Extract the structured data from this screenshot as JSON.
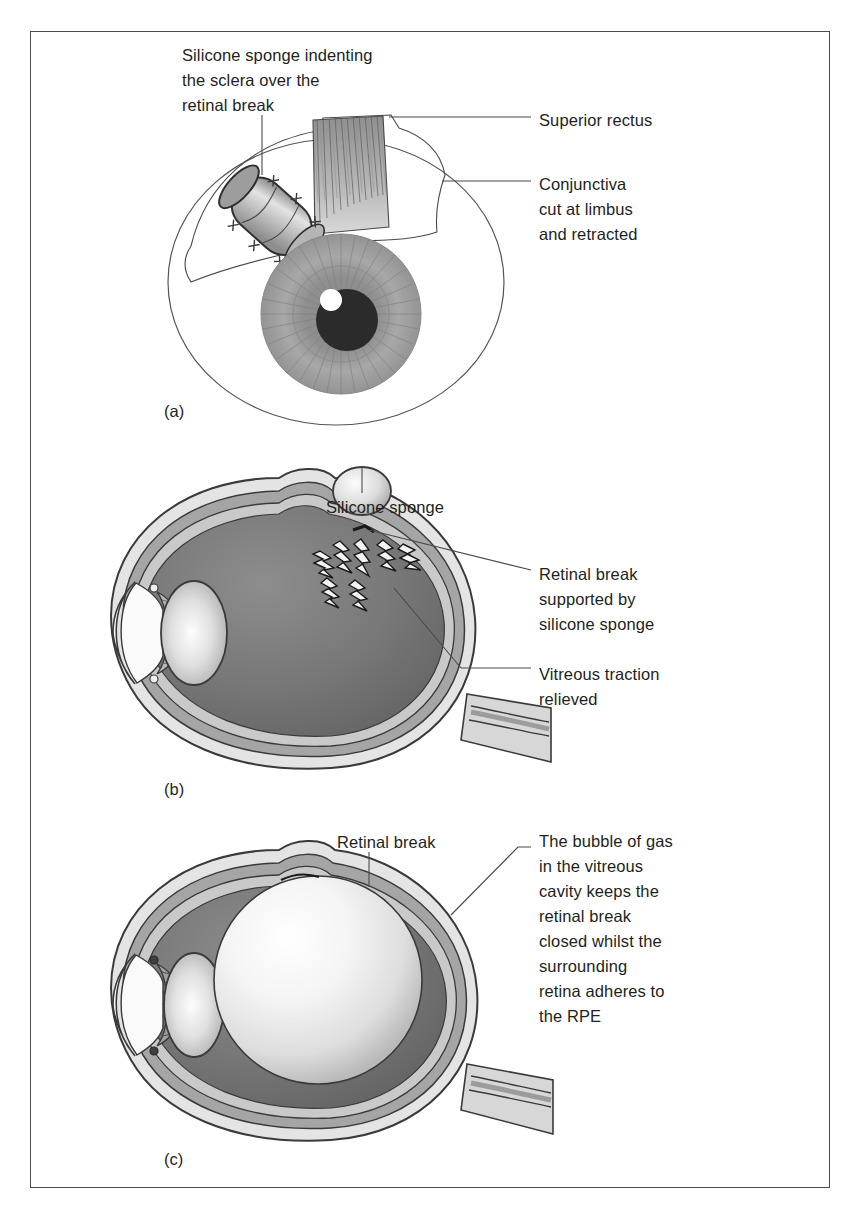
{
  "figure": {
    "domain": "medical-illustration",
    "border_color": "#4a4a4a",
    "background": "#ffffff",
    "text_color": "#231f20"
  },
  "panels": [
    {
      "id": "a",
      "letter": "(a)",
      "view": "external frontal view of eye with silicone sponge sutured to sclera",
      "labels": [
        {
          "name": "silicone-sponge-indenting-label",
          "text": "Silicone sponge indenting\nthe sclera over the\nretinal break",
          "align": "left"
        },
        {
          "name": "superior-rectus-label",
          "text": "Superior rectus",
          "align": "left"
        },
        {
          "name": "conjunctiva-label",
          "text": "Conjunctiva\ncut at limbus\nand retracted",
          "align": "left"
        }
      ],
      "parts": {
        "globe": "eyeball",
        "iris": "iris",
        "pupil": "pupil",
        "highlight": "corneal-light-reflex",
        "sponge": "silicone-sponge",
        "sutures": "sclera-sutures",
        "muscle": "superior-rectus-muscle",
        "conjunctiva": "retracted-conjunctiva"
      }
    },
    {
      "id": "b",
      "letter": "(b)",
      "view": "sagittal cross-section with scleral buckle sponge and relieved vitreous traction",
      "labels": [
        {
          "name": "silicone-sponge-label",
          "text": "Silicone sponge",
          "align": "center"
        },
        {
          "name": "retinal-break-supported-label",
          "text": "Retinal break\nsupported by\nsilicone sponge",
          "align": "left"
        },
        {
          "name": "vitreous-traction-relieved-label",
          "text": "Vitreous traction\nrelieved",
          "align": "left"
        }
      ],
      "parts": {
        "sclera": "sclera",
        "choroid": "choroid",
        "retina": "retina",
        "vitreous": "vitreous-cavity",
        "lens": "lens",
        "cornea": "cornea",
        "anterior_chamber": "anterior-chamber",
        "ciliary_body": "ciliary-body",
        "optic_nerve": "optic-nerve",
        "sponge": "silicone-sponge",
        "break": "retinal-break",
        "traction": "vitreous-traction-flashes"
      }
    },
    {
      "id": "c",
      "letter": "(c)",
      "view": "sagittal cross-section with intravitreal gas bubble tamponading the retinal break",
      "labels": [
        {
          "name": "retinal-break-label",
          "text": "Retinal break",
          "align": "center"
        },
        {
          "name": "gas-bubble-description-label",
          "text": "The bubble of gas\nin the vitreous\ncavity keeps the\nretinal break\nclosed whilst the\nsurrounding\nretina adheres to\nthe RPE",
          "align": "left"
        }
      ],
      "parts": {
        "sclera": "sclera",
        "choroid": "choroid",
        "retina": "retina",
        "vitreous": "vitreous-cavity",
        "gas_bubble": "gas-bubble",
        "lens": "lens",
        "cornea": "cornea",
        "anterior_chamber": "anterior-chamber",
        "ciliary_body": "ciliary-body",
        "optic_nerve": "optic-nerve",
        "break": "retinal-break"
      }
    }
  ],
  "palette": {
    "line": "#3a3a3a",
    "sclera_outer": "#d9d9d9",
    "sclera_inner": "#f0f0f0",
    "choroid": "#9a9a9a",
    "retina": "#c4c4c4",
    "vitreous_dark": "#6e6e6e",
    "vitreous_mid": "#828282",
    "iris": "#9e9e9e",
    "pupil": "#2b2b2b",
    "sponge": "#cfcfcf",
    "gas_bubble": "#fbfbfb",
    "lens": "#e4e4e4",
    "leader": "#4a4a4a"
  }
}
